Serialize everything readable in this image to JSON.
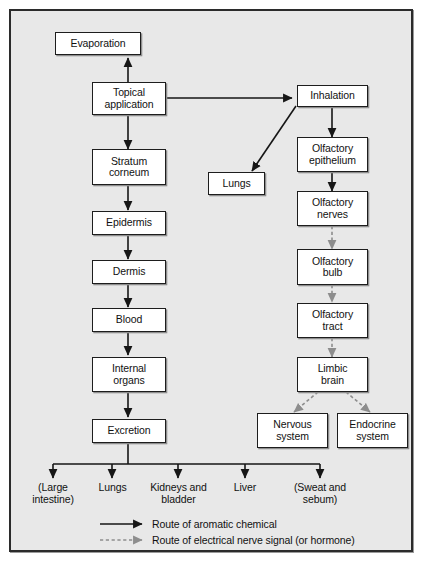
{
  "diagram": {
    "background_color": "#e8e8e8",
    "frame_color": "#2b2b2b",
    "node_fill": "#ffffff",
    "solid_arrow_color": "#161616",
    "dashed_arrow_color": "#8d8d8d"
  },
  "nodes": {
    "evaporation": "Evaporation",
    "topical_application": "Topical\napplication",
    "topical_application_line1": "Topical",
    "topical_application_line2": "application",
    "inhalation": "Inhalation",
    "lungs_box": "Lungs",
    "olfactory_epithelium_line1": "Olfactory",
    "olfactory_epithelium_line2": "epithelium",
    "stratum_corneum_line1": "Stratum",
    "stratum_corneum_line2": "corneum",
    "epidermis": "Epidermis",
    "olfactory_nerves_line1": "Olfactory",
    "olfactory_nerves_line2": "nerves",
    "dermis": "Dermis",
    "olfactory_bulb_line1": "Olfactory",
    "olfactory_bulb_line2": "bulb",
    "blood": "Blood",
    "olfactory_tract_line1": "Olfactory",
    "olfactory_tract_line2": "tract",
    "internal_organs_line1": "Internal",
    "internal_organs_line2": "organs",
    "limbic_brain_line1": "Limbic",
    "limbic_brain_line2": "brain",
    "excretion": "Excretion",
    "nervous_system_line1": "Nervous",
    "nervous_system_line2": "system",
    "endocrine_system_line1": "Endocrine",
    "endocrine_system_line2": "system"
  },
  "excretion_outputs": [
    {
      "line1": "(Large",
      "line2": "intestine)"
    },
    {
      "line1": "Lungs",
      "line2": ""
    },
    {
      "line1": "Kidneys and",
      "line2": "bladder"
    },
    {
      "line1": "Liver",
      "line2": ""
    },
    {
      "line1": "(Sweat and",
      "line2": "sebum)"
    }
  ],
  "legend": {
    "solid_label": "Route of aromatic chemical",
    "dashed_label": "Route of electrical nerve signal (or hormone)"
  }
}
